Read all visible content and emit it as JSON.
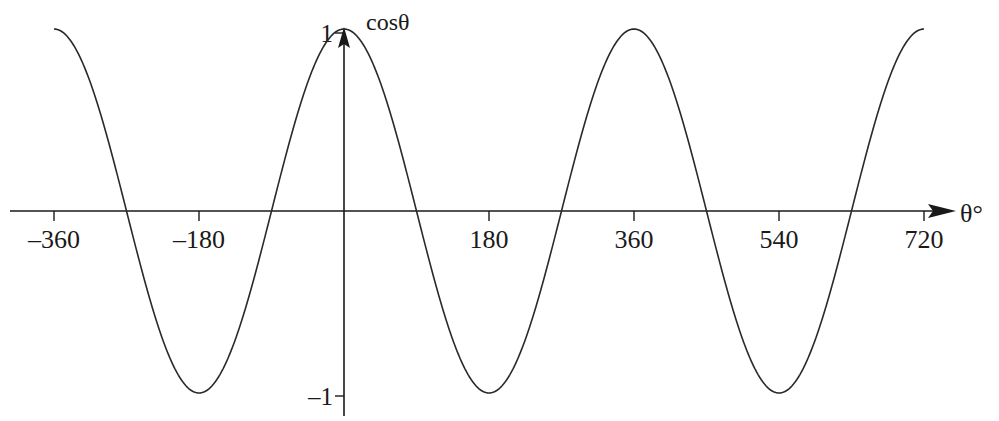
{
  "chart_data": {
    "type": "line",
    "title": "",
    "function": "cos(theta)",
    "xlabel": "θ°",
    "ylabel": "cosθ",
    "xlim": [
      -360,
      720
    ],
    "ylim": [
      -1,
      1
    ],
    "x_ticks": [
      -360,
      -180,
      180,
      360,
      540,
      720
    ],
    "x_tick_labels": [
      "–360",
      "–180",
      "180",
      "360",
      "540",
      "720"
    ],
    "y_ticks": [
      1,
      -1
    ],
    "y_tick_labels": [
      "1",
      "–1"
    ],
    "grid": false,
    "legend": null,
    "series": [
      {
        "name": "cosθ",
        "x": [
          -360,
          -270,
          -180,
          -90,
          0,
          90,
          180,
          270,
          360,
          450,
          540,
          630,
          720
        ],
        "values": [
          1,
          0,
          -1,
          0,
          1,
          0,
          -1,
          0,
          1,
          0,
          -1,
          0,
          1
        ]
      }
    ],
    "colors": {
      "curve": "#2a2a2a",
      "axes": "#1a1a1a",
      "background": "#ffffff"
    }
  }
}
